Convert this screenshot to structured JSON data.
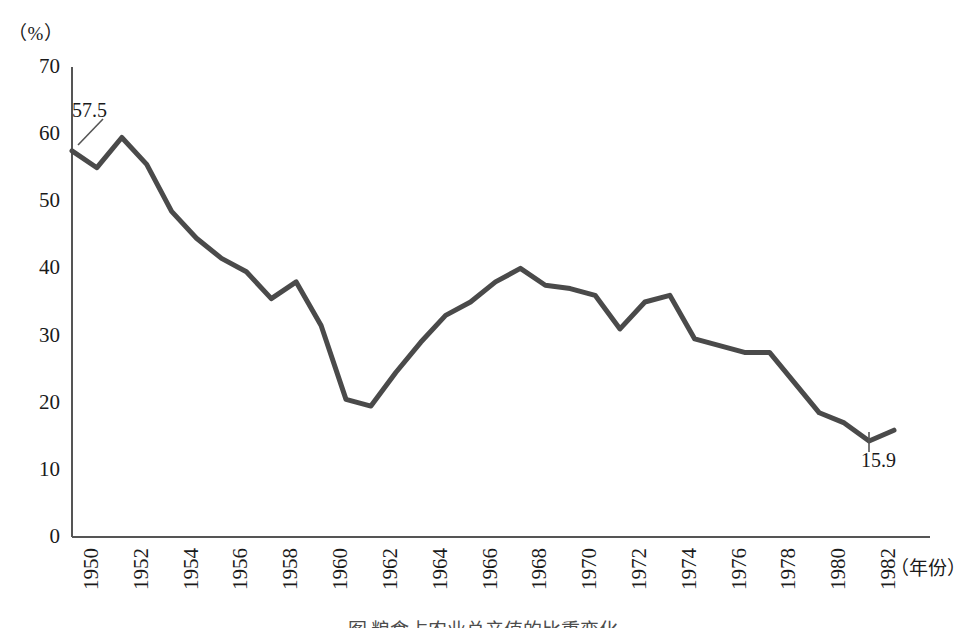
{
  "axes": {
    "y_unit_label": "（%）",
    "x_unit_label": "（年份）",
    "y_ticks": [
      "70",
      "60",
      "50",
      "40",
      "30",
      "20",
      "10",
      "0"
    ],
    "x_ticks": [
      "1950",
      "1952",
      "1954",
      "1956",
      "1958",
      "1960",
      "1962",
      "1964",
      "1966",
      "1968",
      "1970",
      "1972",
      "1974",
      "1976",
      "1978",
      "1980",
      "1982"
    ]
  },
  "annotations": {
    "first_point": "57.5",
    "last_point": "15.9"
  },
  "caption": "图 粮食占农业总产值的比重变化",
  "colors": {
    "line": "#4a4a4a",
    "axis": "#555555",
    "text": "#1a1a1a"
  },
  "chart_data": {
    "type": "line",
    "title": "",
    "xlabel": "（年份）",
    "ylabel": "（%）",
    "xlim": [
      1950,
      1983
    ],
    "ylim": [
      0,
      70
    ],
    "grid": false,
    "legend": false,
    "x": [
      1950,
      1951,
      1952,
      1953,
      1954,
      1955,
      1956,
      1957,
      1958,
      1959,
      1960,
      1961,
      1962,
      1963,
      1964,
      1965,
      1966,
      1967,
      1968,
      1969,
      1970,
      1971,
      1972,
      1973,
      1974,
      1975,
      1976,
      1977,
      1978,
      1979,
      1980,
      1981,
      1982,
      1983
    ],
    "values": [
      57.5,
      55.0,
      59.5,
      55.5,
      48.5,
      44.5,
      41.5,
      39.5,
      35.5,
      38.0,
      31.5,
      20.5,
      19.5,
      24.5,
      29.0,
      33.0,
      35.0,
      38.0,
      40.0,
      37.5,
      37.0,
      36.0,
      31.0,
      35.0,
      36.0,
      29.5,
      28.5,
      27.5,
      27.5,
      23.0,
      18.5,
      17.0,
      14.3,
      15.9
    ],
    "series": [
      {
        "name": "比重",
        "values": [
          57.5,
          55.0,
          59.5,
          55.5,
          48.5,
          44.5,
          41.5,
          39.5,
          35.5,
          38.0,
          31.5,
          20.5,
          19.5,
          24.5,
          29.0,
          33.0,
          35.0,
          38.0,
          40.0,
          37.5,
          37.0,
          36.0,
          31.0,
          35.0,
          36.0,
          29.5,
          28.5,
          27.5,
          27.5,
          23.0,
          18.5,
          17.0,
          14.3,
          15.9
        ]
      }
    ],
    "annotated_points": [
      {
        "x": 1950,
        "y": 57.5,
        "label": "57.5"
      },
      {
        "x": 1983,
        "y": 15.9,
        "label": "15.9"
      }
    ]
  }
}
